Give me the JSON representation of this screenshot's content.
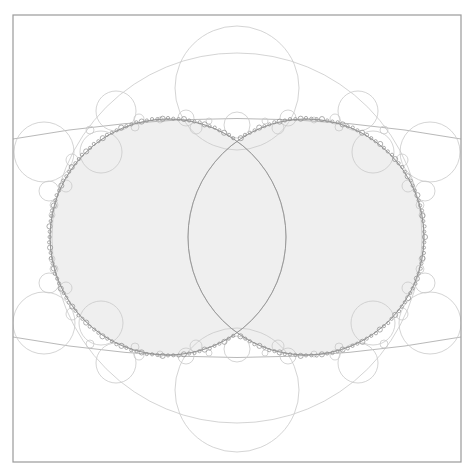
{
  "diagram": {
    "type": "circle-packing-limit-set",
    "canvas": {
      "width": 475,
      "height": 473,
      "background": "#ffffff"
    },
    "frame": {
      "x": 13,
      "y": 15,
      "width": 448,
      "height": 447,
      "stroke": "#9a9a9a"
    },
    "colors": {
      "fill": "#efefef",
      "thin_stroke": "#c9c9c9",
      "mid_stroke": "#b0b0b0",
      "boundary_stroke": "#8c8c8c"
    },
    "filled_disks": [
      {
        "name": "left-disk",
        "cx": 168,
        "cy": 237,
        "r": 118
      },
      {
        "name": "right-disk",
        "cx": 306,
        "cy": 237,
        "r": 118
      }
    ],
    "lens_arcs": [
      {
        "name": "left-lens-arc",
        "cx": 306,
        "cy": 237,
        "r": 118
      },
      {
        "name": "right-lens-arc",
        "cx": 168,
        "cy": 237,
        "r": 118
      }
    ],
    "big_circles": [
      {
        "name": "outer-ring",
        "cx": 237,
        "cy": 238,
        "r": 185
      },
      {
        "name": "top-circle",
        "cx": 237,
        "cy": 88,
        "r": 62
      },
      {
        "name": "bottom-circle",
        "cx": 237,
        "cy": 390,
        "r": 62
      }
    ],
    "cross_arcs": [
      {
        "name": "top-cross-arc",
        "d": "M13,139 Q237,98 461,139"
      },
      {
        "name": "bottom-cross-arc",
        "d": "M13,337 Q237,378 461,337"
      }
    ],
    "circles": [
      {
        "cx": 44,
        "cy": 152,
        "r": 30
      },
      {
        "cx": 430,
        "cy": 152,
        "r": 30
      },
      {
        "cx": 44,
        "cy": 323,
        "r": 31
      },
      {
        "cx": 430,
        "cy": 323,
        "r": 31
      },
      {
        "cx": 116,
        "cy": 111,
        "r": 20
      },
      {
        "cx": 358,
        "cy": 111,
        "r": 20
      },
      {
        "cx": 116,
        "cy": 363,
        "r": 20
      },
      {
        "cx": 358,
        "cy": 363,
        "r": 20
      },
      {
        "cx": 101,
        "cy": 152,
        "r": 21
      },
      {
        "cx": 373,
        "cy": 152,
        "r": 21
      },
      {
        "cx": 101,
        "cy": 323,
        "r": 22
      },
      {
        "cx": 373,
        "cy": 323,
        "r": 22
      },
      {
        "cx": 237,
        "cy": 125,
        "r": 13
      },
      {
        "cx": 237,
        "cy": 349,
        "r": 13
      },
      {
        "cx": 186,
        "cy": 118,
        "r": 8
      },
      {
        "cx": 288,
        "cy": 118,
        "r": 8
      },
      {
        "cx": 186,
        "cy": 356,
        "r": 8
      },
      {
        "cx": 288,
        "cy": 356,
        "r": 8
      },
      {
        "cx": 196,
        "cy": 128,
        "r": 6
      },
      {
        "cx": 278,
        "cy": 128,
        "r": 6
      },
      {
        "cx": 196,
        "cy": 346,
        "r": 6
      },
      {
        "cx": 278,
        "cy": 346,
        "r": 6
      },
      {
        "cx": 49,
        "cy": 191,
        "r": 10
      },
      {
        "cx": 425,
        "cy": 191,
        "r": 10
      },
      {
        "cx": 49,
        "cy": 283,
        "r": 10
      },
      {
        "cx": 425,
        "cy": 283,
        "r": 10
      },
      {
        "cx": 66,
        "cy": 186,
        "r": 6
      },
      {
        "cx": 408,
        "cy": 186,
        "r": 6
      },
      {
        "cx": 66,
        "cy": 288,
        "r": 6
      },
      {
        "cx": 408,
        "cy": 288,
        "r": 6
      },
      {
        "cx": 72,
        "cy": 160,
        "r": 6
      },
      {
        "cx": 402,
        "cy": 160,
        "r": 6
      },
      {
        "cx": 72,
        "cy": 314,
        "r": 6
      },
      {
        "cx": 402,
        "cy": 314,
        "r": 6
      },
      {
        "cx": 139,
        "cy": 119,
        "r": 5
      },
      {
        "cx": 335,
        "cy": 119,
        "r": 5
      },
      {
        "cx": 139,
        "cy": 355,
        "r": 5
      },
      {
        "cx": 335,
        "cy": 355,
        "r": 5
      },
      {
        "cx": 135,
        "cy": 127,
        "r": 4
      },
      {
        "cx": 339,
        "cy": 127,
        "r": 4
      },
      {
        "cx": 135,
        "cy": 347,
        "r": 4
      },
      {
        "cx": 339,
        "cy": 347,
        "r": 4
      },
      {
        "cx": 90,
        "cy": 130,
        "r": 4
      },
      {
        "cx": 384,
        "cy": 130,
        "r": 4
      },
      {
        "cx": 90,
        "cy": 344,
        "r": 4
      },
      {
        "cx": 384,
        "cy": 344,
        "r": 4
      },
      {
        "cx": 54,
        "cy": 205,
        "r": 4
      },
      {
        "cx": 420,
        "cy": 205,
        "r": 4
      },
      {
        "cx": 54,
        "cy": 269,
        "r": 4
      },
      {
        "cx": 420,
        "cy": 269,
        "r": 4
      },
      {
        "cx": 52,
        "cy": 215,
        "r": 3
      },
      {
        "cx": 422,
        "cy": 215,
        "r": 3
      },
      {
        "cx": 52,
        "cy": 259,
        "r": 3
      },
      {
        "cx": 422,
        "cy": 259,
        "r": 3
      },
      {
        "cx": 160,
        "cy": 120,
        "r": 3
      },
      {
        "cx": 314,
        "cy": 120,
        "r": 3
      },
      {
        "cx": 160,
        "cy": 354,
        "r": 3
      },
      {
        "cx": 314,
        "cy": 354,
        "r": 3
      },
      {
        "cx": 209,
        "cy": 121,
        "r": 3
      },
      {
        "cx": 265,
        "cy": 121,
        "r": 3
      },
      {
        "cx": 209,
        "cy": 353,
        "r": 3
      },
      {
        "cx": 265,
        "cy": 353,
        "r": 3
      }
    ],
    "boundary_beads": {
      "count_per_disk": 140,
      "radius": 1.6
    }
  }
}
